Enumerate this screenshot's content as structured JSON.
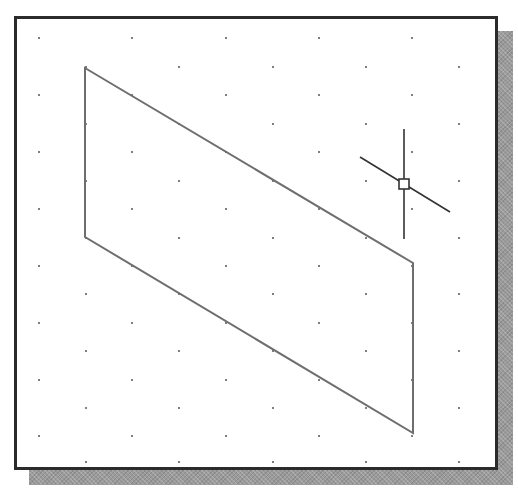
{
  "figure": {
    "colors": {
      "frame": "#2b2b2b",
      "shadow": "#9a9a9a",
      "background": "#ffffff",
      "grid_dot": "#555555",
      "shape_stroke": "#6e6e6e",
      "cursor": "#333333"
    },
    "grid": {
      "type": "isometric",
      "even_row_x": [
        39,
        132,
        226,
        319,
        412
      ],
      "odd_row_x": [
        86,
        179,
        273,
        366,
        459
      ],
      "row_y": [
        38,
        67,
        95,
        124,
        152,
        181,
        209,
        238,
        266,
        294,
        323,
        351,
        380,
        408,
        436,
        462
      ],
      "first_row_parity": "even"
    },
    "shape": {
      "name": "parallelogram",
      "points": [
        [
          85,
          68
        ],
        [
          413,
          263
        ],
        [
          413,
          433
        ],
        [
          85,
          237
        ]
      ]
    },
    "cursor": {
      "center": [
        404,
        184
      ],
      "box_size": 10,
      "vertical_line": [
        [
          404,
          129
        ],
        [
          404,
          239
        ]
      ],
      "iso_line": [
        [
          360,
          157
        ],
        [
          450,
          212
        ]
      ]
    }
  }
}
